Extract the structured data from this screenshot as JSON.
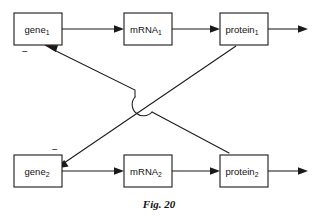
{
  "figure": {
    "caption": "Fig. 20",
    "width": 318,
    "height": 218,
    "background_color": "#ffffff",
    "ink_color": "#1a1a1a"
  },
  "nodes": [
    {
      "id": "gene1",
      "base_label": "gene",
      "subscript": "1",
      "row": "top",
      "x": 14,
      "y": 13,
      "w": 48,
      "h": 32
    },
    {
      "id": "mrna1",
      "base_label": "mRNA",
      "subscript": "1",
      "row": "top",
      "x": 124,
      "y": 13,
      "w": 48,
      "h": 32
    },
    {
      "id": "protein1",
      "base_label": "protein",
      "subscript": "1",
      "row": "top",
      "x": 220,
      "y": 13,
      "w": 48,
      "h": 32
    },
    {
      "id": "gene2",
      "base_label": "gene",
      "subscript": "2",
      "row": "bottom",
      "x": 14,
      "y": 155,
      "w": 48,
      "h": 32
    },
    {
      "id": "mrna2",
      "base_label": "mRNA",
      "subscript": "2",
      "row": "bottom",
      "x": 124,
      "y": 155,
      "w": 48,
      "h": 32
    },
    {
      "id": "protein2",
      "base_label": "protein",
      "subscript": "2",
      "row": "bottom",
      "x": 220,
      "y": 155,
      "w": 48,
      "h": 32
    }
  ],
  "edges": [
    {
      "id": "gene1-to-mrna1",
      "from": "gene1",
      "to": "mrna1",
      "kind": "production"
    },
    {
      "id": "mrna1-to-protein1",
      "from": "mrna1",
      "to": "protein1",
      "kind": "production"
    },
    {
      "id": "protein1-output",
      "from": "protein1",
      "to": "output",
      "kind": "output"
    },
    {
      "id": "gene2-to-mrna2",
      "from": "gene2",
      "to": "mrna2",
      "kind": "production"
    },
    {
      "id": "mrna2-to-protein2",
      "from": "mrna2",
      "to": "protein2",
      "kind": "production"
    },
    {
      "id": "protein2-output",
      "from": "protein2",
      "to": "output",
      "kind": "output"
    },
    {
      "id": "protein1-inhibits-gene2",
      "from": "protein1",
      "to": "gene2",
      "kind": "inhibition"
    },
    {
      "id": "protein2-inhibits-gene1",
      "from": "protein2",
      "to": "gene1",
      "kind": "inhibition"
    }
  ],
  "annotations": [
    {
      "id": "minus-gene1",
      "symbol": "−",
      "near_node": "gene1",
      "x": 25,
      "y": 52
    },
    {
      "id": "minus-gene2",
      "symbol": "−",
      "near_node": "gene2",
      "x": 55,
      "y": 150
    }
  ]
}
